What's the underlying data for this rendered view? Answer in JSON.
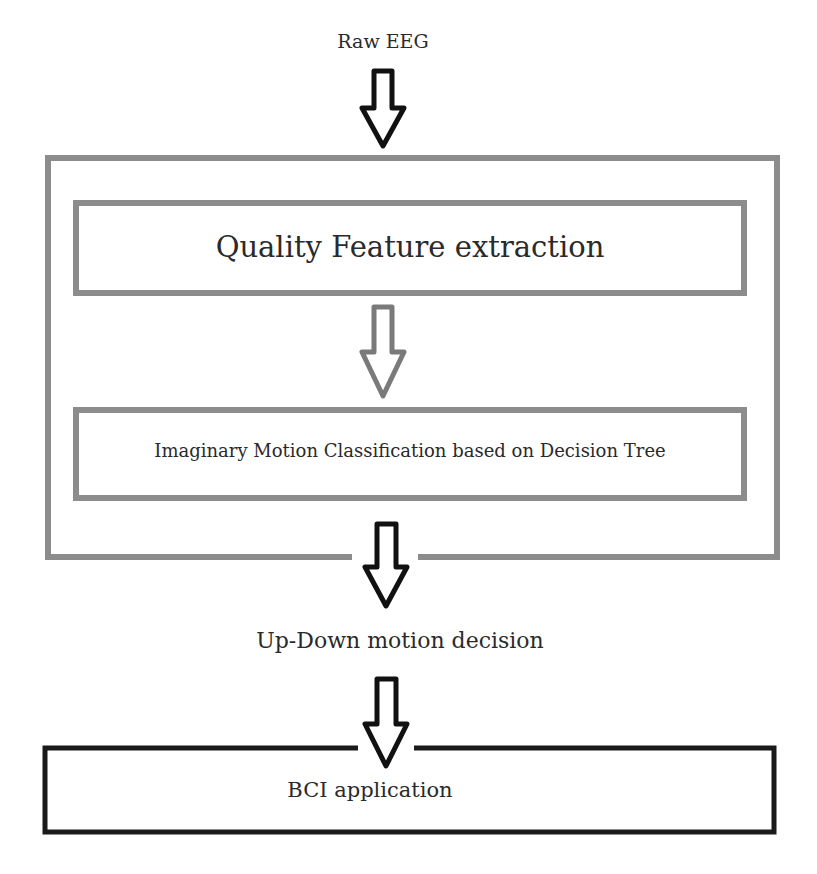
{
  "diagram": {
    "input_label": "Raw EEG",
    "outer_block": {
      "stage1_label": "Quality Feature extraction",
      "stage2_label": "Imaginary Motion Classification based on Decision Tree"
    },
    "decision_label": "Up-Down motion decision",
    "output_label": "BCI application",
    "colors": {
      "gray_border": "#8a8a8a",
      "black_border": "#1a1a1a",
      "text": "#2a2a2a",
      "background": "#ffffff"
    },
    "arrows": [
      {
        "from": "Raw EEG",
        "to": "outer_block",
        "color": "black"
      },
      {
        "from": "Quality Feature extraction",
        "to": "Imaginary Motion Classification based on Decision Tree",
        "color": "gray"
      },
      {
        "from": "outer_block",
        "to": "Up-Down motion decision",
        "color": "black"
      },
      {
        "from": "Up-Down motion decision",
        "to": "BCI application",
        "color": "black"
      }
    ]
  }
}
